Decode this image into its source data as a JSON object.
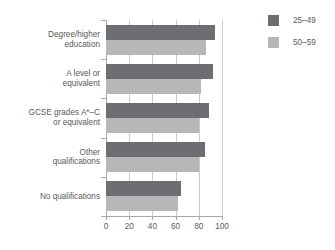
{
  "chart_data": {
    "type": "bar",
    "orientation": "horizontal",
    "title": "",
    "xlabel": "",
    "ylabel": "",
    "xlim": [
      0,
      100
    ],
    "xticks": [
      0,
      20,
      40,
      60,
      80,
      100
    ],
    "xtick_labels": [
      "0",
      "20",
      "40",
      "60",
      "80",
      "100"
    ],
    "grid": true,
    "grid_axis": "x",
    "legend_position": "top-right",
    "categories": [
      "Degree/higher education",
      "A level or equivalent",
      "GCSE grades A*–C or equivalent",
      "Other qualifications",
      "No qualifications"
    ],
    "category_lines": [
      [
        "Degree/higher",
        "education"
      ],
      [
        "A level or",
        "equivalent"
      ],
      [
        "GCSE grades A*–C",
        "or equivalent"
      ],
      [
        "Other",
        "qualifications"
      ],
      [
        "No qualifications"
      ]
    ],
    "series": [
      {
        "name": "25–49",
        "color": "#6d6e71",
        "values": [
          94,
          92,
          89,
          85,
          65
        ]
      },
      {
        "name": "50–59",
        "color": "#b6b7b9",
        "values": [
          86,
          82,
          80,
          80,
          62
        ]
      }
    ]
  },
  "legend": {
    "items": [
      {
        "label": "25–49",
        "color": "#6d6e71"
      },
      {
        "label": "50–59",
        "color": "#b6b7b9"
      }
    ]
  },
  "title_clipped": "",
  "colors": {
    "series_25_49": "#6d6e71",
    "series_50_59": "#b6b7b9",
    "axis": "#a7a9ac",
    "grid": "#c9cacc",
    "text": "#58595b",
    "background": "#ffffff"
  }
}
